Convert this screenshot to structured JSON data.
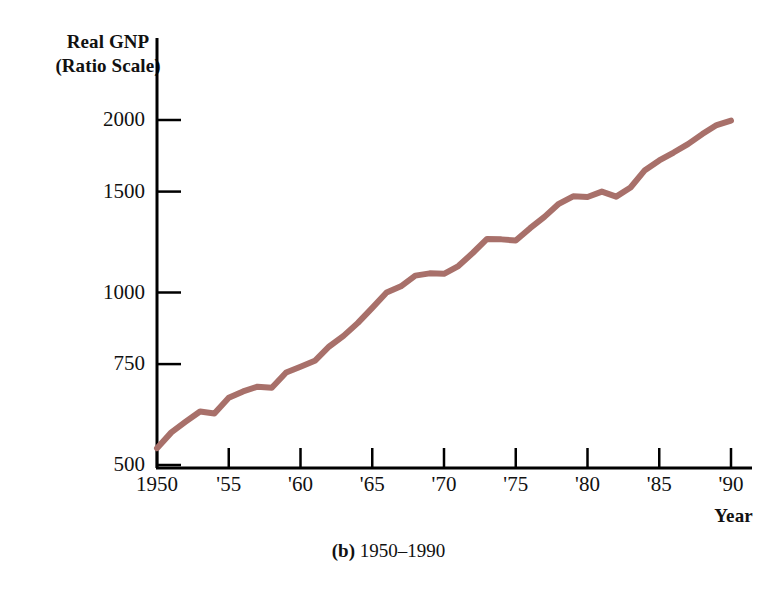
{
  "figure": {
    "y_axis_title_line1": "Real GNP",
    "y_axis_title_line2": "(Ratio Scale)",
    "x_axis_title": "Year",
    "caption_label": "(b)",
    "caption_text": "1950–1990",
    "line_color": "#a8706a",
    "axis_color": "#000000",
    "background_color": "#ffffff"
  },
  "chart_data": {
    "type": "line",
    "title": "Real GNP (Ratio Scale)",
    "subtitle": "(b) 1950–1990",
    "xlabel": "Year",
    "ylabel": "Real GNP (Ratio Scale)",
    "yscale": "log",
    "ylim": [
      500,
      2100
    ],
    "xlim": [
      1950,
      1990
    ],
    "grid": false,
    "legend": "none",
    "ytick_labels": [
      "2000",
      "1500",
      "1000",
      "750",
      "500"
    ],
    "ytick_values": [
      2000,
      1500,
      1000,
      750,
      500
    ],
    "xtick_labels": [
      "1950",
      "'55",
      "'60",
      "'65",
      "'70",
      "'75",
      "'80",
      "'85",
      "'90"
    ],
    "xtick_values": [
      1950,
      1955,
      1960,
      1965,
      1970,
      1975,
      1980,
      1985,
      1990
    ],
    "x": [
      1950,
      1951,
      1952,
      1953,
      1954,
      1955,
      1956,
      1957,
      1958,
      1959,
      1960,
      1961,
      1962,
      1963,
      1964,
      1965,
      1966,
      1967,
      1968,
      1969,
      1970,
      1971,
      1972,
      1973,
      1974,
      1975,
      1976,
      1977,
      1978,
      1979,
      1980,
      1981,
      1982,
      1983,
      1984,
      1985,
      1986,
      1987,
      1988,
      1989,
      1990
    ],
    "series": [
      {
        "name": "Real GNP",
        "values": [
          535,
          570,
          595,
          620,
          615,
          655,
          672,
          685,
          682,
          725,
          742,
          760,
          805,
          840,
          885,
          940,
          1000,
          1025,
          1070,
          1080,
          1078,
          1112,
          1172,
          1240,
          1238,
          1232,
          1295,
          1355,
          1428,
          1472,
          1468,
          1500,
          1470,
          1525,
          1635,
          1700,
          1755,
          1815,
          1890,
          1960,
          1995
        ]
      }
    ]
  }
}
